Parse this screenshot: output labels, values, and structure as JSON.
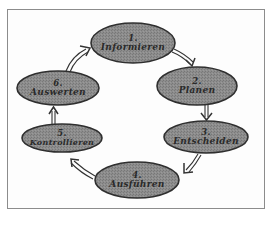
{
  "diagram": {
    "type": "cycle",
    "colors": {
      "node_fill": "#8a8a8a",
      "node_stroke": "#2f2f2f",
      "text": "#2a2a2a",
      "frame": "#8c8c8c",
      "arrow": "#333333"
    },
    "nodes": [
      {
        "id": "informieren",
        "number": "1.",
        "label": "Informieren"
      },
      {
        "id": "planen",
        "number": "2.",
        "label": "Planen"
      },
      {
        "id": "entscheiden",
        "number": "3.",
        "label": "Entscheiden"
      },
      {
        "id": "ausfuehren",
        "number": "4.",
        "label": "Ausführen"
      },
      {
        "id": "kontrollieren",
        "number": "5.",
        "label": "Kontrollieren"
      },
      {
        "id": "auswerten",
        "number": "6.",
        "label": "Auswerten"
      }
    ],
    "edges": [
      {
        "from": "informieren",
        "to": "planen"
      },
      {
        "from": "planen",
        "to": "entscheiden"
      },
      {
        "from": "entscheiden",
        "to": "ausfuehren"
      },
      {
        "from": "ausfuehren",
        "to": "kontrollieren"
      },
      {
        "from": "kontrollieren",
        "to": "auswerten"
      },
      {
        "from": "auswerten",
        "to": "informieren"
      }
    ]
  }
}
